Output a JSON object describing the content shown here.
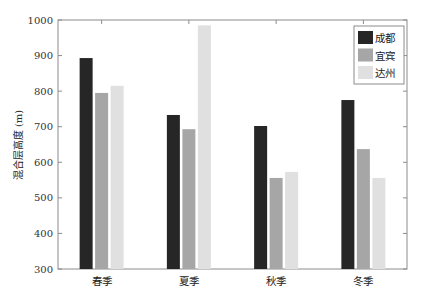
{
  "chart_data": {
    "type": "bar",
    "title": "",
    "xlabel": "",
    "ylabel": "混合层高度 (m)",
    "ylim": [
      300,
      1000
    ],
    "yticks": [
      300,
      400,
      500,
      600,
      700,
      800,
      900,
      1000
    ],
    "categories": [
      "春季",
      "夏季",
      "秋季",
      "冬季"
    ],
    "series": [
      {
        "name": "成都",
        "color": "#262626",
        "values": [
          893,
          733,
          702,
          775
        ]
      },
      {
        "name": "宜宾",
        "color": "#a6a6a6",
        "values": [
          795,
          693,
          556,
          637
        ]
      },
      {
        "name": "达州",
        "color": "#e0e0e0",
        "values": [
          815,
          985,
          573,
          556
        ]
      }
    ],
    "grid": false,
    "legend": "top-right"
  }
}
